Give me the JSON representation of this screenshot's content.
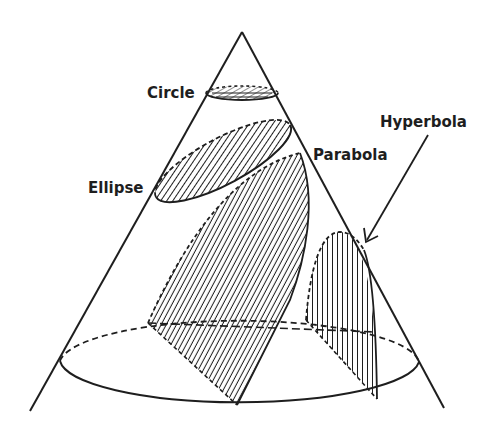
{
  "diagram": {
    "labels": {
      "circle": "Circle",
      "ellipse": "Ellipse",
      "parabola": "Parabola",
      "hyperbola": "Hyperbola"
    },
    "colors": {
      "ink": "#1e1e1e",
      "background": "#ffffff"
    }
  }
}
